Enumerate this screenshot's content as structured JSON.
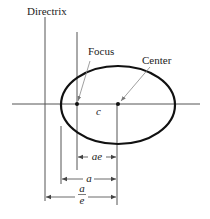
{
  "diagram": {
    "labels": {
      "directrix": "Directrix",
      "focus": "Focus",
      "center": "Center",
      "c": "c",
      "ae": "ae",
      "a": "a",
      "a_over_e_num": "a",
      "a_over_e_den": "e"
    },
    "colors": {
      "ellipse": "#111111",
      "lines": "#444444",
      "text": "#222222"
    }
  }
}
